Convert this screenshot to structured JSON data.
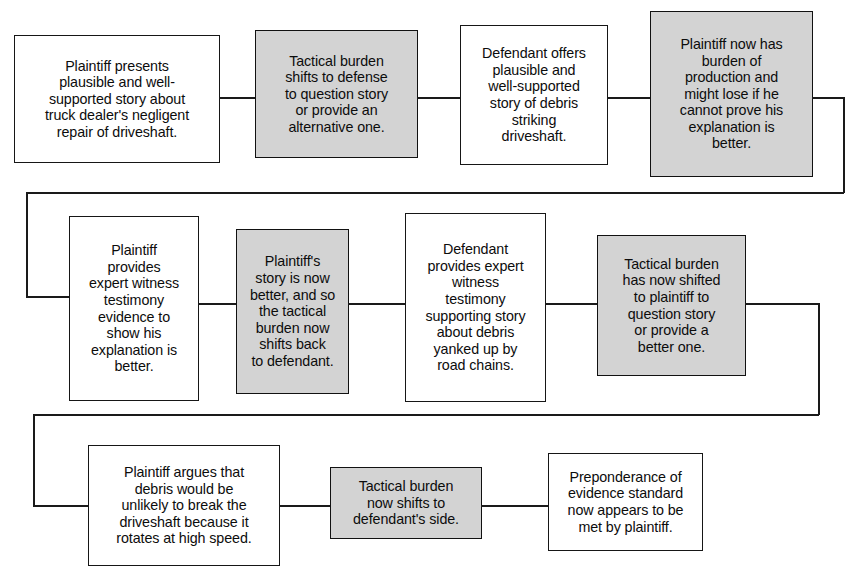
{
  "diagram": {
    "colors": {
      "shaded_fill": "#d3d3d3",
      "plain_fill": "#ffffff",
      "stroke": "#161616",
      "text": "#0c0c0c"
    },
    "rows": [
      {
        "name": "row-1",
        "nodes": [
          {
            "id": "node-1",
            "shaded": false,
            "text": "Plaintiff presents\nplausible and well-\nsupported story about\ntruck dealer's negligent\nrepair of driveshaft."
          },
          {
            "id": "node-2",
            "shaded": true,
            "text": "Tactical burden\nshifts to defense\nto question story\nor provide an\nalternative one."
          },
          {
            "id": "node-3",
            "shaded": false,
            "text": "Defendant offers\nplausible and\nwell-supported\nstory of debris\nstriking\ndriveshaft."
          },
          {
            "id": "node-4",
            "shaded": true,
            "text": "Plaintiff now has\nburden of\nproduction and\nmight lose if he\ncannot prove his\nexplanation is\nbetter."
          }
        ]
      },
      {
        "name": "row-2",
        "nodes": [
          {
            "id": "node-5",
            "shaded": false,
            "text": "Plaintiff\nprovides\nexpert witness\ntestimony\nevidence to\nshow his\nexplanation is\nbetter."
          },
          {
            "id": "node-6",
            "shaded": true,
            "text": "Plaintiff's\nstory is now\nbetter, and so\nthe tactical\nburden now\nshifts back\nto defendant."
          },
          {
            "id": "node-7",
            "shaded": false,
            "text": "Defendant\nprovides expert\nwitness\ntestimony\nsupporting story\nabout debris\nyanked up by\nroad chains."
          },
          {
            "id": "node-8",
            "shaded": true,
            "text": "Tactical burden\nhas now shifted\nto plaintiff to\nquestion story\nor provide a\nbetter one."
          }
        ]
      },
      {
        "name": "row-3",
        "nodes": [
          {
            "id": "node-9",
            "shaded": false,
            "text": "Plaintiff argues that\ndebris would be\nunlikely to break the\ndriveshaft because it\nrotates at high speed."
          },
          {
            "id": "node-10",
            "shaded": true,
            "text": "Tactical burden\nnow shifts to\ndefendant's side."
          },
          {
            "id": "node-11",
            "shaded": false,
            "text": "Preponderance of\nevidence standard\nnow appears to be\nmet by plaintiff."
          }
        ]
      }
    ]
  }
}
